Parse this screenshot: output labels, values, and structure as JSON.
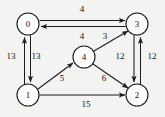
{
  "figure": {
    "kind": "directed-weighted-graph",
    "background_color": "#f3f3f1",
    "stroke_color": "#1c1c1c",
    "node_fill": "#ffffff"
  },
  "nodes": [
    {
      "id": "n0",
      "label": "0",
      "cx": 28,
      "cy": 24,
      "r": 11
    },
    {
      "id": "n3",
      "label": "3",
      "cx": 137,
      "cy": 24,
      "r": 11
    },
    {
      "id": "n1",
      "label": "1",
      "cx": 28,
      "cy": 95,
      "r": 11
    },
    {
      "id": "n2",
      "label": "2",
      "cx": 137,
      "cy": 95,
      "r": 11
    },
    {
      "id": "n4",
      "label": "4",
      "cx": 84,
      "cy": 57,
      "r": 11
    }
  ],
  "edges": [
    {
      "id": "e03",
      "from": "0",
      "to": "3",
      "weight": "4",
      "label_x": 82,
      "label_y": 10
    },
    {
      "id": "e30",
      "from": "3",
      "to": "0",
      "weight": "4",
      "label_x": 82,
      "label_y": 37
    },
    {
      "id": "e10",
      "from": "1",
      "to": "0",
      "weight": "13",
      "label_x": 11,
      "label_y": 57
    },
    {
      "id": "e01",
      "from": "0",
      "to": "1",
      "weight": "13",
      "label_x": 36,
      "label_y": 57
    },
    {
      "id": "e32",
      "from": "3",
      "to": "2",
      "weight": "12",
      "label_x": 120,
      "label_y": 57
    },
    {
      "id": "e23",
      "from": "2",
      "to": "3",
      "weight": "12",
      "label_x": 152,
      "label_y": 57
    },
    {
      "id": "e14",
      "from": "1",
      "to": "4",
      "weight": "5",
      "label_x": 62,
      "label_y": 79
    },
    {
      "id": "e43",
      "from": "4",
      "to": "3",
      "weight": "3",
      "label_x": 105,
      "label_y": 37
    },
    {
      "id": "e42",
      "from": "4",
      "to": "2",
      "weight": "6",
      "label_x": 104,
      "label_y": 79
    },
    {
      "id": "e12",
      "from": "1",
      "to": "2",
      "weight": "15",
      "label_x": 86,
      "label_y": 105
    }
  ]
}
